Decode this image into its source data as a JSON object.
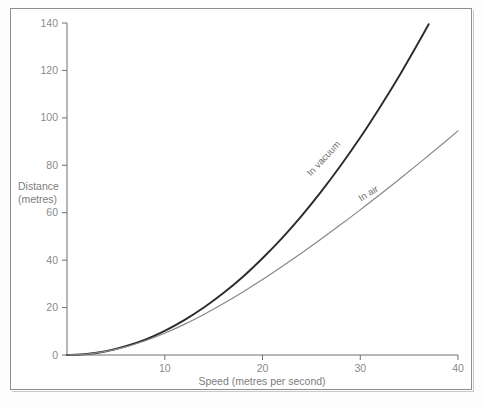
{
  "chart_data": {
    "type": "line",
    "title": "",
    "xlabel": "Speed (metres per second)",
    "ylabel": "Distance",
    "ylabel_units": "(metres)",
    "xlim": [
      0,
      40
    ],
    "ylim": [
      0,
      140
    ],
    "grid": false,
    "legend_position": "inline-curve-labels",
    "xticks": [
      10,
      20,
      30,
      40
    ],
    "xtick_labels": [
      "10",
      "20",
      "30",
      "40"
    ],
    "yticks": [
      0,
      20,
      40,
      60,
      80,
      100,
      120,
      140
    ],
    "ytick_labels": [
      "0",
      "20",
      "40",
      "60",
      "80",
      "100",
      "120",
      "140"
    ],
    "series": [
      {
        "name": "In vacuum",
        "color": "#2b2b2b",
        "width": 1.9,
        "x": [
          0,
          2,
          4,
          6,
          8,
          10,
          12,
          14,
          16,
          18,
          20,
          22,
          24,
          26,
          28,
          30,
          32,
          34,
          36,
          37
        ],
        "values": [
          0,
          0.4,
          1.6,
          3.7,
          6.5,
          10.2,
          14.7,
          20.0,
          26.1,
          33.0,
          40.8,
          49.3,
          58.7,
          68.9,
          79.9,
          91.7,
          104.4,
          117.8,
          132.1,
          139.5
        ]
      },
      {
        "name": "In air",
        "color": "#888888",
        "width": 1.2,
        "x": [
          0,
          2,
          4,
          6,
          8,
          10,
          12,
          14,
          16,
          18,
          20,
          22,
          24,
          26,
          28,
          30,
          32,
          34,
          36,
          38,
          40
        ],
        "values": [
          0,
          0.4,
          1.5,
          3.4,
          6.0,
          9.2,
          12.9,
          17.1,
          21.7,
          26.6,
          31.8,
          37.3,
          43.0,
          48.9,
          55.0,
          61.2,
          67.6,
          74.1,
          80.8,
          87.6,
          94.5
        ]
      }
    ],
    "annotations": [
      {
        "text": "In vacuum",
        "x": 26.5,
        "y": 82,
        "rotation": -47
      },
      {
        "text": "In air",
        "x": 31.0,
        "y": 67,
        "rotation": -32
      }
    ]
  }
}
